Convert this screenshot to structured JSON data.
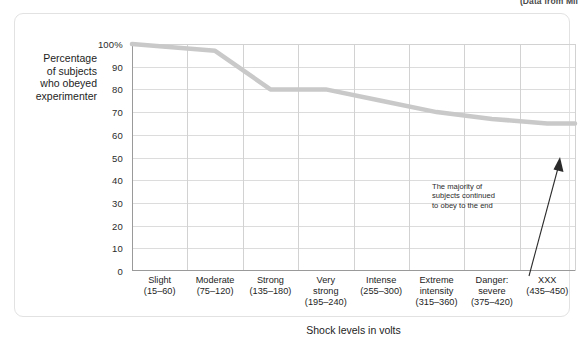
{
  "source_note": "(Data from Mil",
  "axis_title_y_lines": [
    "Percentage",
    "of subjects",
    "who obeyed",
    "experimenter"
  ],
  "axis_title_x": "Shock levels in volts",
  "annotation_lines": [
    "The majority of",
    "subjects continued",
    "to obey to the end"
  ],
  "colors": {
    "line": "#c9c9c9",
    "grid": "#d8d8d8",
    "axis": "#9a9a9a",
    "text": "#1d1d1d",
    "panel_border": "#e2e2e2"
  },
  "chart_data": {
    "type": "line",
    "title": "",
    "xlabel": "Shock levels in volts",
    "ylabel": "Percentage of subjects who obeyed experimenter",
    "ylim": [
      0,
      100
    ],
    "yticks": [
      0,
      10,
      20,
      30,
      40,
      50,
      60,
      70,
      80,
      90,
      100
    ],
    "ytick_labels": [
      "0",
      "10",
      "20",
      "30",
      "40",
      "50",
      "60",
      "70",
      "80",
      "90",
      "100%"
    ],
    "categories": [
      "Slight",
      "Moderate",
      "Strong",
      "Very strong",
      "Intense",
      "Extreme intensity",
      "Danger: severe",
      "XXX"
    ],
    "category_labels": [
      {
        "name": "Slight",
        "range": "(15–60)"
      },
      {
        "name": "Moderate",
        "range": "(75–120)"
      },
      {
        "name": "Strong",
        "range": "(135–180)"
      },
      {
        "name": "Very\nstrong",
        "range": "(195–240)"
      },
      {
        "name": "Intense",
        "range": "(255–300)"
      },
      {
        "name": "Extreme\nintensity",
        "range": "(315–360)"
      },
      {
        "name": "Danger:\nsevere",
        "range": "(375–420)"
      },
      {
        "name": "XXX",
        "range": "(435–450)"
      }
    ],
    "values": [
      100,
      97,
      80,
      80,
      75,
      70,
      67,
      65
    ],
    "grid": true,
    "legend": "none",
    "annotations": [
      {
        "text": "The majority of subjects continued to obey to the end",
        "target_category": "XXX"
      }
    ]
  }
}
